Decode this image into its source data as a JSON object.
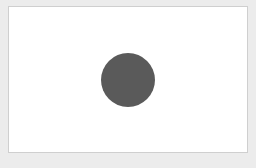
{
  "canvas": {
    "background_color": "#ececec",
    "panel_color": "#ffffff",
    "panel_border_color": "#cfcfcf"
  },
  "shape": {
    "type": "circle",
    "fill_color": "#5a5a5a",
    "center_x": 128,
    "center_y": 80,
    "radius": 27
  }
}
